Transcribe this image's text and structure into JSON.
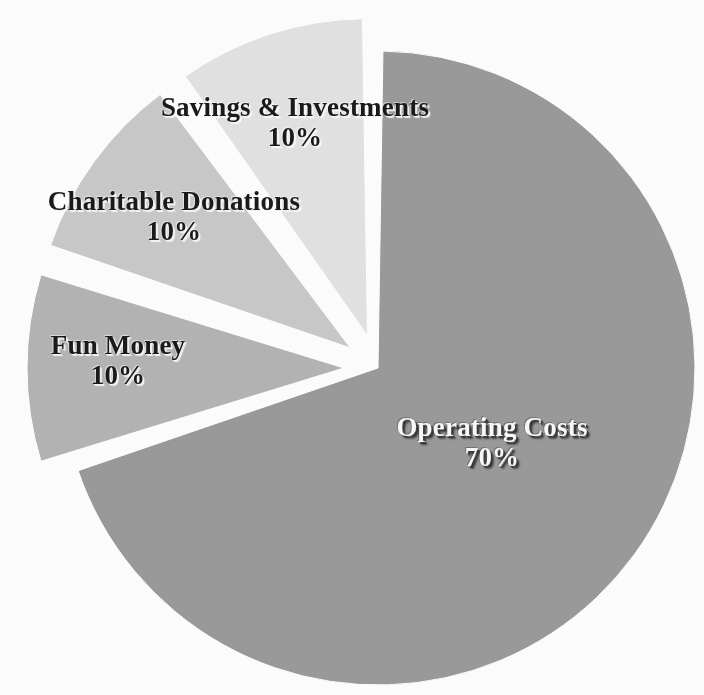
{
  "chart_data": {
    "type": "pie",
    "title": "",
    "subtitle": "",
    "xlabel": "",
    "ylabel": "",
    "legend_position": "none",
    "grid": false,
    "units": "percent",
    "label_format": "{name}\n{value}%",
    "categories": [
      "Operating Costs",
      "Savings & Investments",
      "Charitable Donations",
      "Fun Money"
    ],
    "values": [
      70,
      10,
      10,
      10
    ],
    "slices": [
      {
        "name": "Operating Costs",
        "value": 70,
        "value_label": "70%",
        "color": "#9a9a9a",
        "exploded": false,
        "start_angle_deg": 0,
        "sweep_deg": 252,
        "label_color": "#f7f7f7"
      },
      {
        "name": "Savings & Investments",
        "value": 10,
        "value_label": "10%",
        "color": "#b4b4b4",
        "exploded": true,
        "start_angle_deg": 252,
        "sweep_deg": 36,
        "label_color": "#1a1a1a"
      },
      {
        "name": "Charitable Donations",
        "value": 10,
        "value_label": "10%",
        "color": "#c9c9c9",
        "exploded": true,
        "start_angle_deg": 288,
        "sweep_deg": 36,
        "label_color": "#1a1a1a"
      },
      {
        "name": "Fun Money",
        "value": 10,
        "value_label": "10%",
        "color": "#e2e2e2",
        "exploded": true,
        "start_angle_deg": 324,
        "sweep_deg": 36,
        "label_color": "#1a1a1a"
      }
    ]
  },
  "labels": {
    "operating": {
      "name": "Operating Costs",
      "value": "70%"
    },
    "savings": {
      "name": "Savings & Investments",
      "value": "10%"
    },
    "charity": {
      "name": "Charitable Donations",
      "value": "10%"
    },
    "fun": {
      "name": "Fun Money",
      "value": "10%"
    }
  },
  "colors": {
    "background": "#fdfdfd",
    "operating": "#9a9a9a",
    "savings": "#b4b4b4",
    "charity": "#c9c9c9",
    "fun": "#e2e2e2",
    "gap": "#ffffff"
  }
}
